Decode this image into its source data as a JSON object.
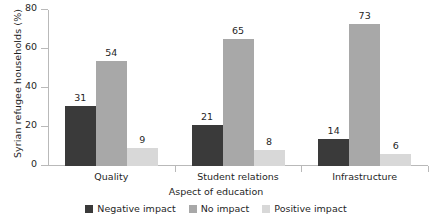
{
  "chart_data": {
    "type": "bar",
    "title": "",
    "subtitle": "",
    "xlabel": "Aspect of education",
    "ylabel": "Syrian refugee households (%)",
    "categories": [
      "Quality",
      "Student relations",
      "Infrastructure"
    ],
    "series": [
      {
        "name": "Negative impact",
        "color": "#3a3a3a",
        "values": [
          31,
          21,
          14
        ]
      },
      {
        "name": "No impact",
        "color": "#a8a8a8",
        "values": [
          54,
          65,
          73
        ]
      },
      {
        "name": "Positive impact",
        "color": "#d8d8d8",
        "values": [
          9,
          8,
          6
        ]
      }
    ],
    "ylim": [
      0,
      80
    ],
    "yticks": [
      0,
      20,
      40,
      60,
      80
    ],
    "ytick_labels": [
      "0",
      "20",
      "40",
      "60",
      "80"
    ],
    "grid": false,
    "legend_position": "bottom",
    "data_labels": true,
    "annotations": []
  },
  "axis": {
    "y_title": "Syrian refugee households (%)",
    "x_title": "Aspect of education"
  }
}
